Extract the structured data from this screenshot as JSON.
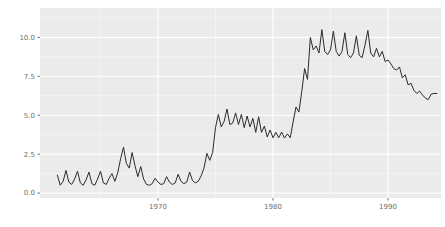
{
  "chart_data": {
    "type": "line",
    "title": "",
    "xlabel": "",
    "ylabel": "",
    "legend": "none",
    "grid": "on",
    "style": "ggplot-grey-panel",
    "x_domain": [
      1959.74,
      1994.61
    ],
    "y_domain": [
      -0.32,
      11.89
    ],
    "x_major_ticks": [
      {
        "value": 1970,
        "label": "1970"
      },
      {
        "value": 1980,
        "label": "1980"
      },
      {
        "value": 1990,
        "label": "1990"
      }
    ],
    "y_major_ticks": [
      {
        "value": 0,
        "label": "0.0"
      },
      {
        "value": 2.5,
        "label": "2.5"
      },
      {
        "value": 5,
        "label": "5.0"
      },
      {
        "value": 7.5,
        "label": "7.5"
      },
      {
        "value": 10,
        "label": "10.0"
      }
    ],
    "x_minor_ticks": [
      1965,
      1975,
      1985
    ],
    "y_minor_ticks": [
      1.25,
      3.75,
      6.25,
      8.75,
      11.25
    ],
    "series": [
      {
        "name": "value",
        "x_start": 1961.25,
        "x_step": 0.25,
        "values": [
          1.15,
          0.5,
          0.75,
          1.45,
          0.7,
          0.55,
          0.9,
          1.4,
          0.65,
          0.5,
          0.85,
          1.35,
          0.6,
          0.5,
          0.9,
          1.4,
          0.65,
          0.55,
          0.95,
          1.25,
          0.75,
          1.3,
          2.2,
          2.95,
          1.9,
          1.6,
          2.6,
          1.75,
          1.05,
          1.7,
          0.9,
          0.55,
          0.5,
          0.6,
          0.95,
          0.7,
          0.55,
          0.6,
          1.05,
          0.7,
          0.55,
          0.65,
          1.2,
          0.75,
          0.6,
          0.7,
          1.35,
          0.8,
          0.65,
          0.75,
          1.1,
          1.6,
          2.55,
          2.1,
          2.6,
          4.2,
          5.05,
          4.25,
          4.6,
          5.4,
          4.4,
          4.5,
          5.15,
          4.4,
          5.05,
          4.2,
          4.95,
          4.25,
          4.8,
          3.9,
          4.9,
          3.9,
          4.3,
          3.6,
          4.05,
          3.55,
          3.9,
          3.55,
          3.92,
          3.53,
          3.8,
          3.55,
          4.57,
          5.53,
          5.2,
          6.5,
          8.0,
          7.3,
          10.0,
          9.2,
          9.45,
          9.0,
          10.5,
          9.1,
          8.9,
          9.2,
          10.4,
          9.1,
          8.8,
          9.1,
          10.3,
          8.9,
          8.7,
          9.0,
          10.1,
          8.85,
          8.7,
          9.5,
          10.45,
          9.0,
          8.75,
          9.3,
          8.75,
          9.1,
          8.45,
          8.55,
          8.3,
          8.0,
          7.9,
          8.1,
          7.4,
          7.6,
          6.95,
          7.05,
          6.6,
          6.4,
          6.55,
          6.3,
          6.1,
          6.0,
          6.35,
          6.4,
          6.4
        ]
      }
    ],
    "colors": {
      "page_bg": "#ffffff",
      "panel_bg": "#ebebeb",
      "grid_major": "#ffffff",
      "grid_minor": "#f6f6f6",
      "line": "#2b2b2b",
      "tick_text": "#6e6e6e",
      "tick_mark": "#4d4d4d"
    }
  }
}
